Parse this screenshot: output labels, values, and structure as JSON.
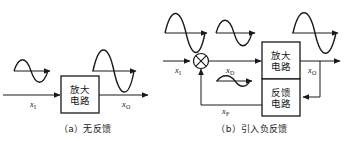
{
  "figure": {
    "kind": "block-diagram",
    "line_color": "#1a1a1a",
    "background": "#ffffff",
    "panels": [
      {
        "id": "a",
        "caption": "（a）无反馈",
        "blocks": [
          {
            "id": "amplifier",
            "line1": "放大",
            "line2": "电路"
          }
        ],
        "signals": [
          {
            "id": "xi",
            "symbol": "x",
            "subscript": "I"
          },
          {
            "id": "xo",
            "symbol": "x",
            "subscript": "O"
          }
        ],
        "waveforms": [
          {
            "id": "input-wave",
            "amplitude": "small",
            "cycles": 1
          },
          {
            "id": "output-wave",
            "amplitude": "large",
            "cycles": 1
          }
        ]
      },
      {
        "id": "b",
        "caption": "（b）引入负反馈",
        "blocks": [
          {
            "id": "amplifier",
            "line1": "放大",
            "line2": "电路"
          },
          {
            "id": "feedback",
            "line1": "反馈",
            "line2": "电路"
          }
        ],
        "signals": [
          {
            "id": "xi",
            "symbol": "x",
            "subscript": "I"
          },
          {
            "id": "xd",
            "symbol": "x",
            "subscript": "D"
          },
          {
            "id": "xf",
            "symbol": "x",
            "subscript": "F"
          },
          {
            "id": "xo",
            "symbol": "x",
            "subscript": "O"
          }
        ],
        "summing_junction": {
          "id": "summer",
          "glyph": "circle-with-x"
        },
        "waveforms": [
          {
            "id": "input-wave",
            "amplitude": "large",
            "cycles": 1
          },
          {
            "id": "net-input-wave",
            "amplitude": "medium",
            "cycles": 1
          },
          {
            "id": "output-wave",
            "amplitude": "large",
            "cycles": 1
          },
          {
            "id": "feedback-wave",
            "amplitude": "tiny",
            "cycles": 1
          }
        ]
      }
    ]
  }
}
